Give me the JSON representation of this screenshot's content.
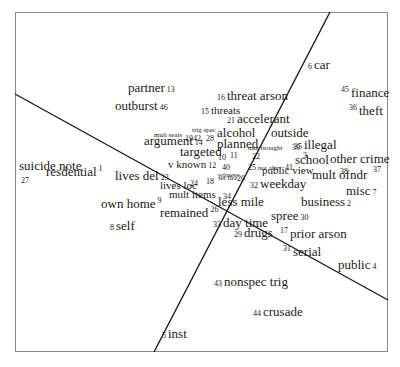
{
  "diagram": {
    "type": "smallest-space-analysis-plot",
    "frame": {
      "x": 15,
      "y": 12,
      "w": 373,
      "h": 340,
      "color": "#8a8a8a"
    },
    "partition_lines": [
      {
        "x1": 15,
        "y1": 94,
        "x2": 388,
        "y2": 300
      },
      {
        "x1": 330,
        "y1": 12,
        "x2": 154,
        "y2": 352
      }
    ],
    "items": [
      {
        "id": "1",
        "label": "resdential",
        "num": "1",
        "x": 46,
        "y": 178,
        "size": 13,
        "num_pos": "after-sup"
      },
      {
        "id": "2",
        "label": "business",
        "num": "2",
        "x": 301,
        "y": 208,
        "size": 13,
        "num_pos": "after"
      },
      {
        "id": "3",
        "label": "",
        "num": "3",
        "x": 303,
        "y": 160,
        "size": 8,
        "num_pos": "only"
      },
      {
        "id": "4",
        "label": "public",
        "num": "4",
        "x": 338,
        "y": 271,
        "size": 13,
        "num_pos": "after"
      },
      {
        "id": "5",
        "label": "inst",
        "num": "5",
        "x": 162,
        "y": 340,
        "size": 13,
        "num_pos": "before"
      },
      {
        "id": "6",
        "label": "car",
        "num": "6",
        "x": 308,
        "y": 71,
        "size": 13,
        "num_pos": "before"
      },
      {
        "id": "7",
        "label": "misc",
        "num": "7",
        "x": 346,
        "y": 197,
        "size": 13,
        "num_pos": "after"
      },
      {
        "id": "8",
        "label": "self",
        "num": "8",
        "x": 110,
        "y": 232,
        "size": 13,
        "num_pos": "before"
      },
      {
        "id": "9",
        "label": "own home",
        "num": "9",
        "x": 101,
        "y": 210,
        "size": 13,
        "num_pos": "after-sup"
      },
      {
        "id": "10",
        "label": "",
        "num": "10",
        "x": 218,
        "y": 162,
        "size": 8,
        "num_pos": "only"
      },
      {
        "id": "11",
        "label": "",
        "num": "11",
        "x": 230,
        "y": 160,
        "size": 8,
        "num_pos": "only"
      },
      {
        "id": "12",
        "label": "v known",
        "num": "12",
        "x": 168,
        "y": 170,
        "size": 11,
        "num_pos": "after"
      },
      {
        "id": "13",
        "label": "partner",
        "num": "13",
        "x": 128,
        "y": 94,
        "size": 13,
        "num_pos": "after"
      },
      {
        "id": "14",
        "label": "argument",
        "num": "14",
        "x": 144,
        "y": 147,
        "size": 13,
        "num_pos": "after"
      },
      {
        "id": "15",
        "label": "threats",
        "num": "15",
        "x": 201,
        "y": 116,
        "size": 11,
        "num_pos": "before"
      },
      {
        "id": "16",
        "label": "threat arson",
        "num": "16",
        "x": 217,
        "y": 102,
        "size": 13,
        "num_pos": "before"
      },
      {
        "id": "17",
        "label": "prior arson",
        "num": "17",
        "x": 280,
        "y": 240,
        "size": 13,
        "num_pos": "before-sup"
      },
      {
        "id": "18",
        "label": "",
        "num": "18",
        "x": 206,
        "y": 186,
        "size": 8,
        "num_pos": "only"
      },
      {
        "id": "19",
        "label": "",
        "num": "19",
        "x": 185,
        "y": 143,
        "size": 8,
        "num_pos": "only"
      },
      {
        "id": "20",
        "label": "",
        "num": "20",
        "x": 237,
        "y": 183,
        "size": 8,
        "num_pos": "only"
      },
      {
        "id": "21",
        "label": "accelerant",
        "num": "21",
        "x": 227,
        "y": 125,
        "size": 13,
        "num_pos": "before"
      },
      {
        "id": "22",
        "label": "",
        "num": "22",
        "x": 252,
        "y": 161,
        "size": 8,
        "num_pos": "only"
      },
      {
        "id": "23",
        "label": "lives del",
        "num": "23",
        "x": 115,
        "y": 182,
        "size": 13,
        "num_pos": "after"
      },
      {
        "id": "24",
        "label": "",
        "num": "24",
        "x": 190,
        "y": 188,
        "size": 8,
        "num_pos": "only"
      },
      {
        "id": "25",
        "label": "not alert",
        "num": "25",
        "x": 248,
        "y": 171,
        "size": 7,
        "num_pos": "before"
      },
      {
        "id": "26",
        "label": "remained",
        "num": "26",
        "x": 160,
        "y": 219,
        "size": 13,
        "num_pos": "after-sup"
      },
      {
        "id": "27",
        "label": "suicide note",
        "num": "27",
        "x": 19,
        "y": 172,
        "size": 13,
        "num_pos": "below"
      },
      {
        "id": "28",
        "label": "",
        "num": "28",
        "x": 206,
        "y": 143,
        "size": 8,
        "num_pos": "only"
      },
      {
        "id": "29",
        "label": "drugs",
        "num": "29",
        "x": 234,
        "y": 239,
        "size": 13,
        "num_pos": "before"
      },
      {
        "id": "30",
        "label": "spree",
        "num": "30",
        "x": 271,
        "y": 222,
        "size": 13,
        "num_pos": "after"
      },
      {
        "id": "31",
        "label": "serial",
        "num": "31",
        "x": 283,
        "y": 258,
        "size": 13,
        "num_pos": "before-sup"
      },
      {
        "id": "32",
        "label": "weekday",
        "num": "32",
        "x": 250,
        "y": 190,
        "size": 13,
        "num_pos": "before"
      },
      {
        "id": "33",
        "label": "day time",
        "num": "33",
        "x": 213,
        "y": 229,
        "size": 13,
        "num_pos": "before"
      },
      {
        "id": "34",
        "label": "",
        "num": "34",
        "x": 223,
        "y": 201,
        "size": 8,
        "num_pos": "only"
      },
      {
        "id": "35",
        "label": "illegal",
        "num": "35",
        "x": 294,
        "y": 151,
        "size": 13,
        "num_pos": "before"
      },
      {
        "id": "36",
        "label": "theft",
        "num": "36",
        "x": 349,
        "y": 117,
        "size": 13,
        "num_pos": "before-sup"
      },
      {
        "id": "37",
        "label": "",
        "num": "37",
        "x": 373,
        "y": 174,
        "size": 8,
        "num_pos": "only"
      },
      {
        "id": "38",
        "label": "",
        "num": "38",
        "x": 340,
        "y": 176,
        "size": 8,
        "num_pos": "only"
      },
      {
        "id": "39",
        "label": "",
        "num": "39",
        "x": 292,
        "y": 152,
        "size": 8,
        "num_pos": "only"
      },
      {
        "id": "40",
        "label": "witness",
        "num": "40",
        "x": 218,
        "y": 171,
        "size": 7,
        "num_pos": "above"
      },
      {
        "id": "41",
        "label": "",
        "num": "41",
        "x": 285,
        "y": 172,
        "size": 8,
        "num_pos": "only"
      },
      {
        "id": "42",
        "label": "",
        "num": "42",
        "x": 193,
        "y": 143,
        "size": 8,
        "num_pos": "only"
      },
      {
        "id": "43",
        "label": "nonspec trig",
        "num": "43",
        "x": 214,
        "y": 288,
        "size": 13,
        "num_pos": "before"
      },
      {
        "id": "44",
        "label": "crusade",
        "num": "44",
        "x": 253,
        "y": 318,
        "size": 13,
        "num_pos": "before"
      },
      {
        "id": "45",
        "label": "finance",
        "num": "45",
        "x": 341,
        "y": 99,
        "size": 13,
        "num_pos": "before-sub"
      },
      {
        "id": "46",
        "label": "outburst",
        "num": "46",
        "x": 115,
        "y": 112,
        "size": 13,
        "num_pos": "after"
      }
    ],
    "extra_labels": [
      {
        "label": "mult seats",
        "x": 154,
        "y": 139,
        "size": 7
      },
      {
        "label": "trig spec",
        "x": 192,
        "y": 134,
        "size": 7
      },
      {
        "label": "alcohol",
        "x": 217,
        "y": 139,
        "size": 13
      },
      {
        "label": "planned",
        "x": 217,
        "y": 150,
        "size": 13
      },
      {
        "label": "mut brought",
        "x": 248,
        "y": 152,
        "size": 7
      },
      {
        "label": "targeted",
        "x": 180,
        "y": 158,
        "size": 13
      },
      {
        "label": "set fire",
        "x": 218,
        "y": 182,
        "size": 7
      },
      {
        "label": "lives loc",
        "x": 160,
        "y": 191,
        "size": 11
      },
      {
        "label": "mult items",
        "x": 169,
        "y": 200,
        "size": 11
      },
      {
        "label": "less mile",
        "x": 218,
        "y": 208,
        "size": 13
      },
      {
        "label": "outside",
        "x": 271,
        "y": 139,
        "size": 13
      },
      {
        "label": "school",
        "x": 295,
        "y": 166,
        "size": 13
      },
      {
        "label": "other crime",
        "x": 330,
        "y": 165,
        "size": 13
      },
      {
        "label": "public view",
        "x": 262,
        "y": 176,
        "size": 11
      },
      {
        "label": "mult ofndr",
        "x": 312,
        "y": 181,
        "size": 13
      }
    ]
  }
}
